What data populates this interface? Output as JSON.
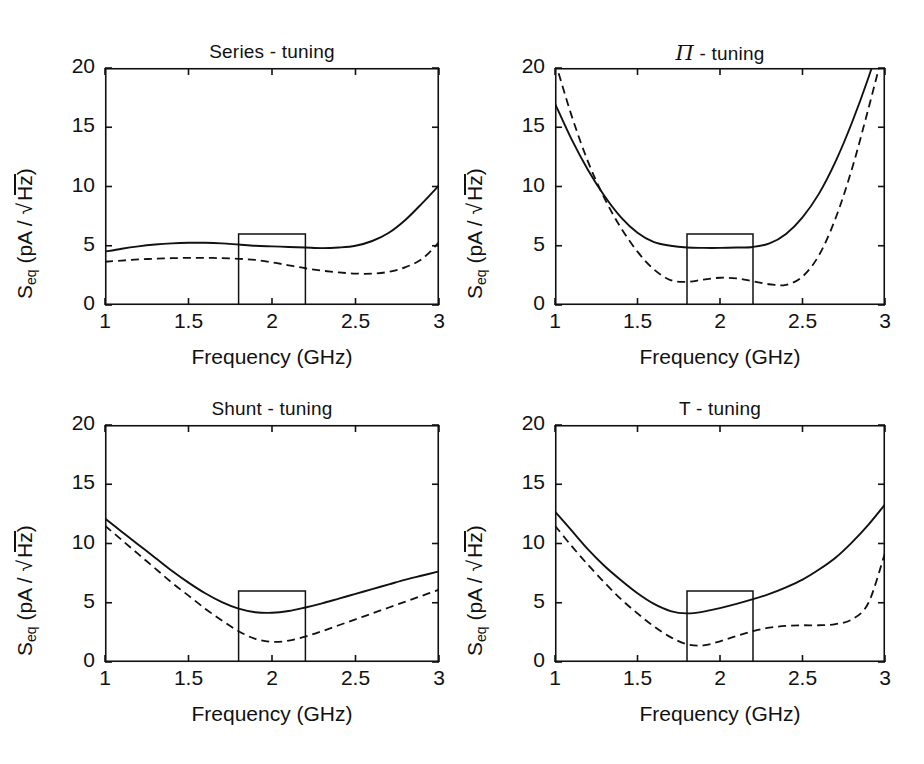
{
  "figure": {
    "background": "#ffffff",
    "ink": "#111111",
    "panel_count": 4
  },
  "axes": {
    "xlabel": "Frequency   (GHz)",
    "ylabel_main": "S",
    "ylabel_sub": "eq",
    "ylabel_units_open": "(pA /",
    "ylabel_units_radicand": "Hz",
    "ylabel_units_close": ")",
    "xticks": [
      "1",
      "1.5",
      "2",
      "2.5",
      "3"
    ],
    "xtick_values": [
      1,
      1.5,
      2,
      2.5,
      3
    ],
    "yticks": [
      "0",
      "5",
      "10",
      "15",
      "20"
    ],
    "ytick_values": [
      0,
      5,
      10,
      15,
      20
    ],
    "xlim": [
      1,
      3
    ],
    "ylim": [
      0,
      20
    ],
    "grid": false,
    "legend": "none"
  },
  "chart_data": [
    {
      "type": "line",
      "title": "Series - tuning",
      "panel": "top-left",
      "xlabel": "Frequency   (GHz)",
      "ylabel": "S_eq (pA/sqrt(Hz))",
      "xlim": [
        1,
        3
      ],
      "ylim": [
        0,
        20
      ],
      "grid": false,
      "x": [
        1.0,
        1.1,
        1.2,
        1.3,
        1.4,
        1.5,
        1.6,
        1.7,
        1.8,
        1.9,
        2.0,
        2.1,
        2.2,
        2.3,
        2.4,
        2.5,
        2.6,
        2.7,
        2.8,
        2.9,
        3.0
      ],
      "series": [
        {
          "name": "solid",
          "style": "solid",
          "values": [
            4.5,
            4.75,
            4.95,
            5.1,
            5.2,
            5.25,
            5.25,
            5.2,
            5.1,
            5.0,
            4.95,
            4.9,
            4.85,
            4.8,
            4.85,
            5.0,
            5.4,
            6.1,
            7.2,
            8.6,
            10.1
          ]
        },
        {
          "name": "dashed",
          "style": "dashed",
          "values": [
            3.65,
            3.75,
            3.85,
            3.9,
            3.95,
            3.98,
            3.98,
            3.95,
            3.9,
            3.8,
            3.6,
            3.35,
            3.1,
            2.9,
            2.75,
            2.65,
            2.65,
            2.8,
            3.2,
            3.9,
            5.3
          ]
        }
      ],
      "spec_box": {
        "x0": 1.8,
        "x1": 2.2,
        "y0": 0,
        "y1": 6
      }
    },
    {
      "type": "line",
      "title": "Π - tuning",
      "panel": "top-right",
      "xlabel": "Frequency   (GHz)",
      "ylabel": "S_eq (pA/sqrt(Hz))",
      "xlim": [
        1,
        3
      ],
      "ylim": [
        0,
        20
      ],
      "grid": false,
      "x": [
        1.0,
        1.1,
        1.2,
        1.3,
        1.4,
        1.5,
        1.6,
        1.7,
        1.8,
        1.9,
        2.0,
        2.1,
        2.2,
        2.3,
        2.4,
        2.5,
        2.6,
        2.7,
        2.8,
        2.9,
        3.0
      ],
      "series": [
        {
          "name": "solid",
          "style": "solid",
          "values": [
            17.0,
            14.0,
            11.4,
            9.2,
            7.4,
            6.1,
            5.3,
            5.0,
            4.85,
            4.82,
            4.82,
            4.85,
            4.9,
            5.2,
            6.0,
            7.4,
            9.4,
            12.1,
            15.4,
            19.2,
            23.5
          ]
        },
        {
          "name": "dashed",
          "style": "dashed",
          "values": [
            20.6,
            16.0,
            12.1,
            9.0,
            6.5,
            4.5,
            3.0,
            2.1,
            1.95,
            2.15,
            2.3,
            2.25,
            2.0,
            1.75,
            1.7,
            2.4,
            4.2,
            7.3,
            11.5,
            16.6,
            22.0
          ]
        }
      ],
      "spec_box": {
        "x0": 1.8,
        "x1": 2.2,
        "y0": 0,
        "y1": 6
      }
    },
    {
      "type": "line",
      "title": "Shunt - tuning",
      "panel": "bottom-left",
      "xlabel": "Frequency   (GHz)",
      "ylabel": "S_eq (pA/sqrt(Hz))",
      "xlim": [
        1,
        3
      ],
      "ylim": [
        0,
        20
      ],
      "grid": false,
      "x": [
        1.0,
        1.1,
        1.2,
        1.3,
        1.4,
        1.5,
        1.6,
        1.7,
        1.8,
        1.9,
        2.0,
        2.1,
        2.2,
        2.3,
        2.4,
        2.5,
        2.6,
        2.7,
        2.8,
        2.9,
        3.0
      ],
      "series": [
        {
          "name": "solid",
          "style": "solid",
          "values": [
            12.1,
            11.0,
            9.9,
            8.8,
            7.7,
            6.7,
            5.8,
            5.05,
            4.5,
            4.2,
            4.15,
            4.3,
            4.6,
            4.95,
            5.35,
            5.75,
            6.15,
            6.55,
            6.95,
            7.3,
            7.65
          ]
        },
        {
          "name": "dashed",
          "style": "dashed",
          "values": [
            11.5,
            10.3,
            9.1,
            7.9,
            6.7,
            5.6,
            4.5,
            3.5,
            2.6,
            1.95,
            1.7,
            1.8,
            2.15,
            2.6,
            3.1,
            3.6,
            4.1,
            4.6,
            5.1,
            5.6,
            6.1
          ]
        }
      ],
      "spec_box": {
        "x0": 1.8,
        "x1": 2.2,
        "y0": 0,
        "y1": 6
      }
    },
    {
      "type": "line",
      "title": "T - tuning",
      "panel": "bottom-right",
      "xlabel": "Frequency   (GHz)",
      "ylabel": "S_eq (pA/sqrt(Hz))",
      "xlim": [
        1,
        3
      ],
      "ylim": [
        0,
        20
      ],
      "grid": false,
      "x": [
        1.0,
        1.1,
        1.2,
        1.3,
        1.4,
        1.5,
        1.6,
        1.7,
        1.8,
        1.9,
        2.0,
        2.1,
        2.2,
        2.3,
        2.4,
        2.5,
        2.6,
        2.7,
        2.8,
        2.9,
        3.0
      ],
      "series": [
        {
          "name": "solid",
          "style": "solid",
          "values": [
            12.7,
            11.1,
            9.5,
            8.1,
            6.9,
            5.8,
            4.9,
            4.3,
            4.1,
            4.25,
            4.55,
            4.9,
            5.3,
            5.75,
            6.3,
            6.95,
            7.8,
            8.8,
            10.1,
            11.6,
            13.3
          ]
        },
        {
          "name": "dashed",
          "style": "dashed",
          "values": [
            11.5,
            9.8,
            8.2,
            6.7,
            5.3,
            4.1,
            3.0,
            2.1,
            1.5,
            1.4,
            1.75,
            2.2,
            2.6,
            2.9,
            3.05,
            3.1,
            3.1,
            3.2,
            3.6,
            5.0,
            9.2
          ]
        }
      ],
      "spec_box": {
        "x0": 1.8,
        "x1": 2.2,
        "y0": 0,
        "y1": 6
      }
    }
  ]
}
